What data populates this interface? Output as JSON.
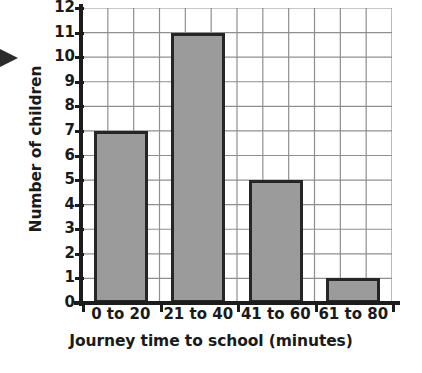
{
  "chart_data": {
    "type": "bar",
    "title": "",
    "xlabel": "Journey time to school (minutes)",
    "ylabel": "Number of children",
    "categories": [
      "0 to 20",
      "21 to 40",
      "41 to 60",
      "61 to 80"
    ],
    "values": [
      7,
      11,
      5,
      1
    ],
    "ylim": [
      0,
      12
    ],
    "ytick_labels": [
      "12",
      "11",
      "10",
      "9",
      "8",
      "7",
      "6",
      "5",
      "4",
      "3",
      "2",
      "1",
      "0"
    ],
    "ytick_values": [
      12,
      11,
      10,
      9,
      8,
      7,
      6,
      5,
      4,
      3,
      2,
      1,
      0
    ],
    "grid": true,
    "grid_horizontal_step": 1,
    "grid_vertical_divisions": 12,
    "legend": null,
    "legend_position": "none",
    "bar_fill_color": "#9b9b9b",
    "bar_edge_color": "#262626",
    "axis_color": "#1c1c1c",
    "grid_color": "#8f8f8f",
    "background_color": "#ffffff"
  },
  "annotations": {
    "left_marker": "arrow-right-marker"
  }
}
